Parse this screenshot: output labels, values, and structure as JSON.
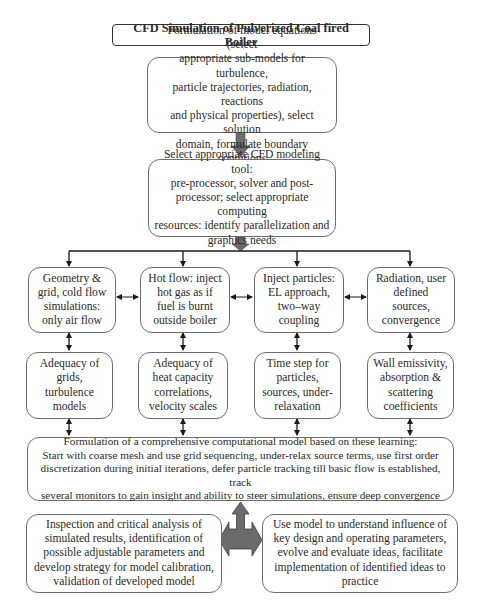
{
  "title": "CFD Simulation of Pulverized Coal fired Boiler",
  "steps": {
    "formulation": "Formulation of model equations (select\nappropriate sub-models for turbulence,\nparticle trajectories, radiation, reactions\nand physical properties), select solution\ndomain, formulate boundary conditions",
    "tool_selection": "Select appropriate CFD modeling tool:\npre-processor, solver and post-\nprocessor; select appropriate computing\nresources: identify parallelization and\ngraphics needs"
  },
  "stages": [
    {
      "label": "Geometry &\ngrid, cold flow\nsimulations:\nonly air flow",
      "check": "Adequacy of\ngrids,\nturbulence\nmodels"
    },
    {
      "label": "Hot flow: inject\nhot gas as if\nfuel is burnt\noutside boiler",
      "check": "Adequacy of\nheat capacity\ncorrelations,\nvelocity scales"
    },
    {
      "label": "Inject particles:\nEL approach,\ntwo–way\ncoupling",
      "check": "Time step for\nparticles,\nsources, under-\nrelaxation"
    },
    {
      "label": "Radiation, user\ndefined\nsources,\nconvergence",
      "check": "Wall emissivity,\nabsorption &\nscattering\ncoefficients"
    }
  ],
  "comprehensive_model": "Formulation of a comprehensive computational model based on these learning:\nStart with coarse mesh and use grid sequencing, under-relax source terms, use first order\ndiscretization during initial iterations, defer particle tracking till basic flow is established, track\nseveral monitors to gain insight and ability to steer simulations, ensure deep convergence",
  "outcomes": {
    "calibration": "Inspection and critical analysis of\nsimulated results, identification of\npossible adjustable parameters and\ndevelop strategy for model calibration,\nvalidation of developed model",
    "application": "Use model to understand influence of\nkey design and operating parameters,\nevolve and evaluate ideas, facilitate\nimplementation of identified ideas to\npractice"
  },
  "colors": {
    "block_arrow": "#6b6b6b",
    "line": "#1a1a1a",
    "box_border": "#6e6e6e"
  }
}
